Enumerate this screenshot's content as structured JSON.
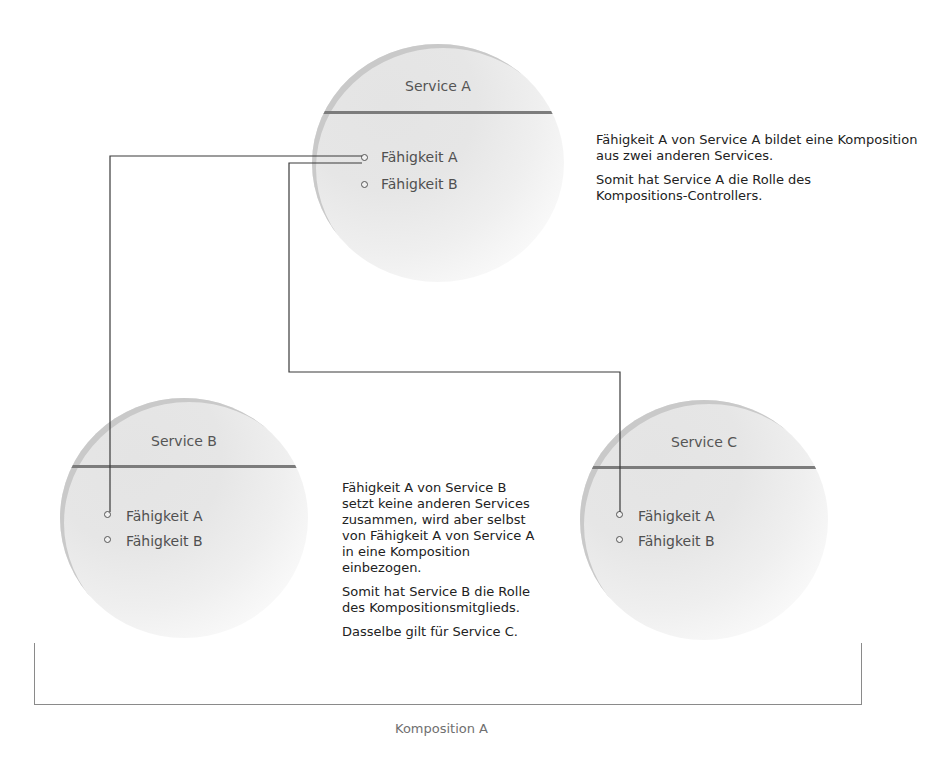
{
  "colors": {
    "circle_fill": "#e6e6e6",
    "divider": "#7c7c7c",
    "wire": "#3a3a3a",
    "bracket": "#8a8a8a",
    "text": "#222222",
    "label_gray": "#707070"
  },
  "services": [
    {
      "id": "service-a",
      "title": "Service A",
      "capabilities": [
        "Fähigkeit A",
        "Fähigkeit B"
      ]
    },
    {
      "id": "service-b",
      "title": "Service B",
      "capabilities": [
        "Fähigkeit A",
        "Fähigkeit B"
      ]
    },
    {
      "id": "service-c",
      "title": "Service C",
      "capabilities": [
        "Fähigkeit A",
        "Fähigkeit B"
      ]
    }
  ],
  "notes": {
    "controller": {
      "p1": "Fähigkeit A von Service A bildet eine Komposition aus zwei anderen Services.",
      "p2": "Somit hat Service A die Rolle des Kompositions-Controllers."
    },
    "member": {
      "p1": "Fähigkeit A von Service B setzt keine anderen Services zusammen, wird aber selbst von Fähigkeit A von Service A in eine Komposition einbezogen.",
      "p2": "Somit hat Service B die Rolle des Kompositionsmitglieds.",
      "p3": "Dasselbe gilt für Service C."
    }
  },
  "composition": {
    "label": "Komposition A"
  },
  "connections": [
    {
      "from": "Service A / Fähigkeit A",
      "to": "Service B / Fähigkeit A"
    },
    {
      "from": "Service A / Fähigkeit A",
      "to": "Service C / Fähigkeit A"
    }
  ]
}
